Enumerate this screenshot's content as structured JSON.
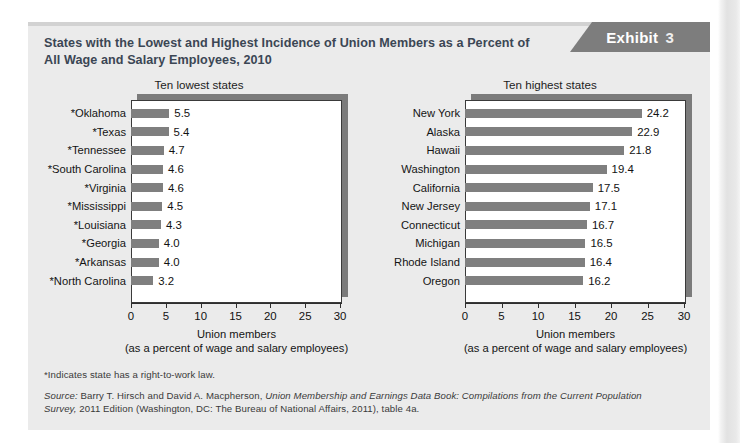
{
  "exhibit": {
    "banner_word": "Exhibit",
    "banner_number": "3",
    "title": "States with the Lowest and Highest Incidence of Union Members as a Percent of All Wage and Salary Employees, 2010"
  },
  "footer": {
    "footnote": "*Indicates state has a right-to-work law.",
    "source_prefix": "Source:",
    "source_text_1": " Barry T. Hirsch and David A. Macpherson, ",
    "source_italic_1": "Union Membership and Earnings Data Book: Compilations from the Current Population Survey,",
    "source_text_2": " 2011 Edition (Washington, DC: The Bureau of National Affairs, 2011), table 4a."
  },
  "chart_data": [
    {
      "type": "bar",
      "orientation": "horizontal",
      "title": "Ten lowest states",
      "xlabel": "Union members",
      "xlabel_sub": "(as a percent of wage and salary employees)",
      "ylabel": "",
      "xlim": [
        0,
        30
      ],
      "xticks": [
        0,
        5,
        10,
        15,
        20,
        25,
        30
      ],
      "xticklabels": [
        "0",
        "5",
        "10",
        "15",
        "20",
        "25",
        "30"
      ],
      "grid": false,
      "legend": "none",
      "bar_color": "#7f7f7f",
      "categories": [
        "*Oklahoma",
        "*Texas",
        "*Tennessee",
        "*South Carolina",
        "*Virginia",
        "*Mississippi",
        "*Louisiana",
        "*Georgia",
        "*Arkansas",
        "*North Carolina"
      ],
      "values": [
        5.5,
        5.4,
        4.7,
        4.6,
        4.6,
        4.5,
        4.3,
        4.0,
        4.0,
        3.2
      ],
      "value_labels": [
        "5.5",
        "5.4",
        "4.7",
        "4.6",
        "4.6",
        "4.5",
        "4.3",
        "4.0",
        "4.0",
        "3.2"
      ]
    },
    {
      "type": "bar",
      "orientation": "horizontal",
      "title": "Ten highest states",
      "xlabel": "Union members",
      "xlabel_sub": "(as a percent of wage and salary employees)",
      "ylabel": "",
      "xlim": [
        0,
        30
      ],
      "xticks": [
        0,
        5,
        10,
        15,
        20,
        25,
        30
      ],
      "xticklabels": [
        "0",
        "5",
        "10",
        "15",
        "20",
        "25",
        "30"
      ],
      "grid": false,
      "legend": "none",
      "bar_color": "#7f7f7f",
      "categories": [
        "New York",
        "Alaska",
        "Hawaii",
        "Washington",
        "California",
        "New Jersey",
        "Connecticut",
        "Michigan",
        "Rhode Island",
        "Oregon"
      ],
      "values": [
        24.2,
        22.9,
        21.8,
        19.4,
        17.5,
        17.1,
        16.7,
        16.5,
        16.4,
        16.2
      ],
      "value_labels": [
        "24.2",
        "22.9",
        "21.8",
        "19.4",
        "17.5",
        "17.1",
        "16.7",
        "16.5",
        "16.4",
        "16.2"
      ]
    }
  ]
}
